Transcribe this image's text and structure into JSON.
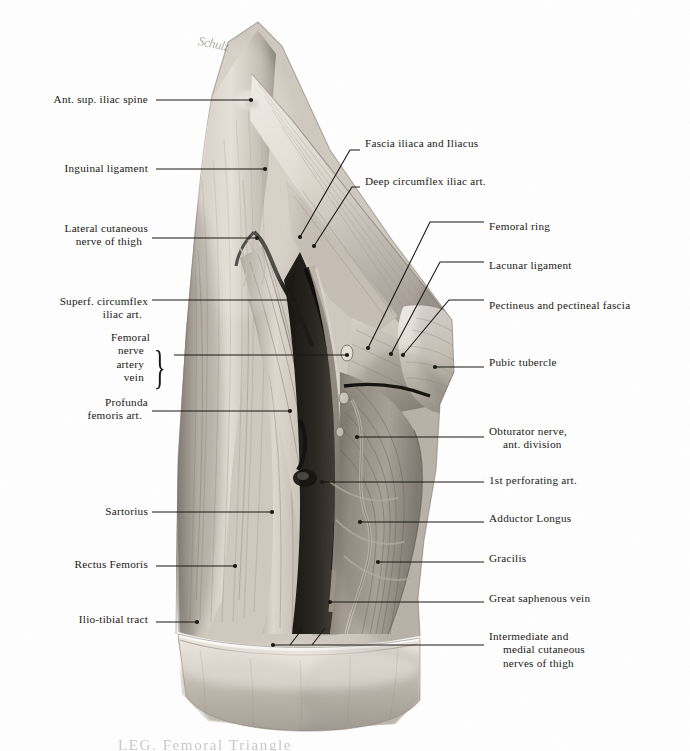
{
  "plate": {
    "title": "Anterior thigh dissection — femoral triangle",
    "signature": "Schulz",
    "caption": "LEG. Femoral Triangle",
    "palette": {
      "background": "#fefefe",
      "leader_line": "#1b1815",
      "text": "#1a1714",
      "muscle_light": "#d9d3ca",
      "muscle_mid": "#b3aaa0",
      "muscle_dark": "#817a72",
      "fascia_pale": "#e6e1d9",
      "vessel_dark": "#3a3631",
      "shadow_deep": "#17150f"
    }
  },
  "labels_left": [
    {
      "id": "ant-sup-iliac-spine",
      "lines": [
        "Ant. sup. iliac spine"
      ],
      "text_right": 148,
      "baseline_y": 102,
      "dash": true,
      "line": {
        "x1": 156,
        "y1": 100,
        "x2": 251,
        "y2": 100
      },
      "dot": {
        "x": 251,
        "y": 100
      }
    },
    {
      "id": "inguinal-ligament",
      "lines": [
        "Inguinal ligament"
      ],
      "text_right": 148,
      "baseline_y": 171,
      "dash": true,
      "line": {
        "x1": 156,
        "y1": 169,
        "x2": 265,
        "y2": 169
      },
      "dot": {
        "x": 265,
        "y": 169
      }
    },
    {
      "id": "lateral-cutaneous-nerve",
      "lines": [
        "Lateral cutaneous",
        "nerve of thigh"
      ],
      "text_right": 148,
      "baseline_y": 231,
      "dash": true,
      "line": {
        "x1": 152,
        "y1": 238,
        "x2": 257,
        "y2": 238
      },
      "dot": {
        "x": 257,
        "y": 238
      }
    },
    {
      "id": "superf-circumflex-iliac",
      "lines": [
        "Superf. circumflex",
        "iliac art."
      ],
      "text_right": 148,
      "baseline_y": 304,
      "dash": true,
      "line": {
        "x1": 152,
        "y1": 300,
        "x2": 295,
        "y2": 300
      },
      "dot": {
        "x": 295,
        "y": 300
      }
    },
    {
      "id": "femoral-nav",
      "lines": [
        "Femoral",
        "nerve",
        "artery",
        "vein"
      ],
      "text_right": 150,
      "baseline_y": 340,
      "dash": false,
      "brace": true,
      "line": {
        "x1": 174,
        "y1": 355,
        "x2": 347,
        "y2": 355
      },
      "dot": {
        "x": 347,
        "y": 355
      }
    },
    {
      "id": "profunda-femoris-art",
      "lines": [
        "Profunda",
        "femoris art."
      ],
      "text_right": 148,
      "baseline_y": 405,
      "dash": true,
      "line": {
        "x1": 152,
        "y1": 411,
        "x2": 290,
        "y2": 411
      },
      "dot": {
        "x": 290,
        "y": 411
      }
    },
    {
      "id": "sartorius",
      "lines": [
        "Sartorius"
      ],
      "text_right": 148,
      "baseline_y": 514,
      "dash": true,
      "line": {
        "x1": 152,
        "y1": 512,
        "x2": 272,
        "y2": 512
      },
      "dot": {
        "x": 272,
        "y": 512
      }
    },
    {
      "id": "rectus-femoris",
      "lines": [
        "Rectus Femoris"
      ],
      "text_right": 148,
      "baseline_y": 567,
      "dash": true,
      "line": {
        "x1": 156,
        "y1": 566,
        "x2": 235,
        "y2": 566
      },
      "dot": {
        "x": 235,
        "y": 566
      }
    },
    {
      "id": "ilio-tibial-tract",
      "lines": [
        "Ilio-tibial tract"
      ],
      "text_right": 148,
      "baseline_y": 622,
      "dash": true,
      "line": {
        "x1": 156,
        "y1": 622,
        "x2": 197,
        "y2": 622
      },
      "dot": {
        "x": 197,
        "y": 622
      }
    }
  ],
  "labels_right": [
    {
      "id": "fascia-iliaca-iliacus",
      "lines": [
        "Fascia iliaca and Iliacus"
      ],
      "text_left": 365,
      "baseline_y": 146,
      "path": "M 360 150 L 350 150 L 300 237",
      "dot": {
        "x": 300,
        "y": 237
      }
    },
    {
      "id": "deep-circumflex-iliac",
      "lines": [
        "Deep circumflex iliac art."
      ],
      "text_left": 365,
      "baseline_y": 184,
      "path": "M 360 187 L 352 187 L 314 246",
      "dot": {
        "x": 314,
        "y": 246
      }
    },
    {
      "id": "femoral-ring",
      "lines": [
        "Femoral ring"
      ],
      "text_left": 489,
      "baseline_y": 229,
      "path": "M 484 222 L 430 222 L 368 348",
      "dot": {
        "x": 368,
        "y": 348
      }
    },
    {
      "id": "lacunar-ligament",
      "lines": [
        "Lacunar ligament"
      ],
      "text_left": 489,
      "baseline_y": 268,
      "path": "M 484 262 L 440 262 L 391 354",
      "dot": {
        "x": 391,
        "y": 354
      }
    },
    {
      "id": "pectineus-pectineal",
      "lines": [
        "Pectineus and pectineal fascia"
      ],
      "text_left": 489,
      "baseline_y": 308,
      "path": "M 484 300 L 449 300 L 403 355",
      "dot": {
        "x": 403,
        "y": 355
      }
    },
    {
      "id": "pubic-tubercle",
      "lines": [
        "Pubic tubercle"
      ],
      "text_left": 489,
      "baseline_y": 365,
      "path": "M 484 367 L 435 367",
      "dot": {
        "x": 435,
        "y": 367
      }
    },
    {
      "id": "obturator-nerve",
      "lines": [
        "Obturator nerve,",
        "ant. division"
      ],
      "text_left": 489,
      "baseline_y": 434,
      "path": "M 484 437 L 357 437",
      "dot": {
        "x": 357,
        "y": 437
      }
    },
    {
      "id": "first-perforating-art",
      "lines": [
        "1st perforating art."
      ],
      "text_left": 489,
      "baseline_y": 483,
      "path": "M 484 482 L 322 482",
      "dot": {
        "x": 322,
        "y": 482
      }
    },
    {
      "id": "adductor-longus",
      "lines": [
        "Adductor Longus"
      ],
      "text_left": 489,
      "baseline_y": 521,
      "path": "M 484 522 L 360 522",
      "dot": {
        "x": 360,
        "y": 522
      }
    },
    {
      "id": "gracilis",
      "lines": [
        "Gracilis"
      ],
      "text_left": 489,
      "baseline_y": 561,
      "path": "M 484 562 L 378 562",
      "dot": {
        "x": 378,
        "y": 562
      }
    },
    {
      "id": "great-saphenous-vein",
      "lines": [
        "Great saphenous vein"
      ],
      "text_left": 489,
      "baseline_y": 601,
      "path": "M 484 602 L 330 602",
      "dot": {
        "x": 330,
        "y": 602
      }
    },
    {
      "id": "intermediate-medial-cut",
      "lines": [
        "Intermediate and",
        "medial cutaneous",
        "nerves of thigh"
      ],
      "text_left": 489,
      "baseline_y": 639,
      "path": "M 484 645 L 273 645",
      "dot": {
        "x": 273,
        "y": 645
      },
      "branches": [
        "M 290 645 L 303 628",
        "M 312 645 L 325 628"
      ]
    }
  ]
}
